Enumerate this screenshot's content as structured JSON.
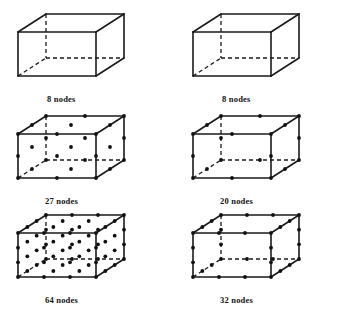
{
  "figure": {
    "background_color": "#ffffff",
    "line_color": "#1a1a1a",
    "node_color": "#111111",
    "columns": 2,
    "rows": 3
  },
  "geometry": {
    "description": "Isometric brick: front face rectangle with top/right faces projected back-up-right.",
    "front": {
      "x0": 10,
      "y0": 28,
      "x1": 88,
      "y1": 72
    },
    "offset": {
      "dx": 28,
      "dy": -18
    },
    "node_radius": 1.9,
    "solid_width": 1.6,
    "dashed_width": 1.3,
    "dash_pattern": "4,3"
  },
  "elements": [
    {
      "id": "hex8-linear",
      "label": "8 nodes",
      "node_count": 8,
      "family": "trilinear Lagrange",
      "edge_divisions": 1,
      "has_face_nodes": false,
      "has_interior_nodes": false,
      "column": "left",
      "row": 1,
      "show_nodes": false,
      "caption_x": 47,
      "caption_y": 95,
      "origin_x": 8,
      "origin_y": 4
    },
    {
      "id": "hex8-serendipity",
      "label": "8 nodes",
      "node_count": 8,
      "family": "trilinear",
      "edge_divisions": 1,
      "has_face_nodes": false,
      "has_interior_nodes": false,
      "column": "right",
      "row": 1,
      "show_nodes": false,
      "caption_x": 222,
      "caption_y": 95,
      "origin_x": 183,
      "origin_y": 4
    },
    {
      "id": "hex27",
      "label": "27 nodes",
      "node_count": 27,
      "family": "triquadratic Lagrange",
      "edge_divisions": 2,
      "has_face_nodes": true,
      "has_interior_nodes": true,
      "column": "left",
      "row": 2,
      "show_nodes": true,
      "caption_x": 45,
      "caption_y": 197,
      "origin_x": 8,
      "origin_y": 106
    },
    {
      "id": "hex20",
      "label": "20 nodes",
      "node_count": 20,
      "family": "quadratic serendipity",
      "edge_divisions": 2,
      "has_face_nodes": false,
      "has_interior_nodes": false,
      "column": "right",
      "row": 2,
      "show_nodes": true,
      "caption_x": 220,
      "caption_y": 197,
      "origin_x": 183,
      "origin_y": 106
    },
    {
      "id": "hex64",
      "label": "64 nodes",
      "node_count": 64,
      "family": "tricubic Lagrange",
      "edge_divisions": 3,
      "has_face_nodes": true,
      "has_interior_nodes": true,
      "column": "left",
      "row": 3,
      "show_nodes": true,
      "caption_x": 45,
      "caption_y": 296,
      "origin_x": 8,
      "origin_y": 205
    },
    {
      "id": "hex32",
      "label": "32 nodes",
      "node_count": 32,
      "family": "cubic serendipity",
      "edge_divisions": 3,
      "has_face_nodes": false,
      "has_interior_nodes": false,
      "column": "right",
      "row": 3,
      "show_nodes": true,
      "caption_x": 220,
      "caption_y": 296,
      "origin_x": 183,
      "origin_y": 205
    }
  ]
}
